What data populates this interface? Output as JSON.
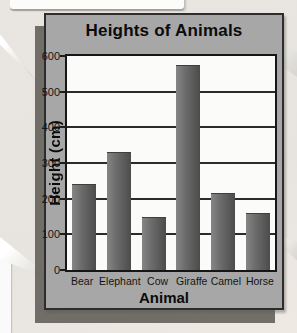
{
  "figure": {
    "title": "Heights of Animals",
    "x_axis_label": "Animal",
    "y_axis_label": "Height (cm)"
  },
  "chart_data": {
    "type": "bar",
    "title": "Heights of Animals",
    "xlabel": "Animal",
    "ylabel": "Height (cm)",
    "categories": [
      "Bear",
      "Elephant",
      "Cow",
      "Giraffe",
      "Camel",
      "Horse"
    ],
    "values": [
      240,
      330,
      150,
      575,
      215,
      160
    ],
    "ylim": [
      0,
      600
    ],
    "yticks": [
      0,
      100,
      200,
      300,
      400,
      500,
      600
    ],
    "grid": true,
    "legend": false
  },
  "colors": {
    "panel_bg": "#a7a7a7",
    "plot_bg": "#fbfbfa",
    "page_bg": "#e8e5e0",
    "bar_light": "#868686",
    "bar_dark": "#4c4c4c",
    "border": "#2d2d2d",
    "gridline": "#2b2b2b",
    "shadow": "#5c5852",
    "text": "#0b0b0b"
  }
}
